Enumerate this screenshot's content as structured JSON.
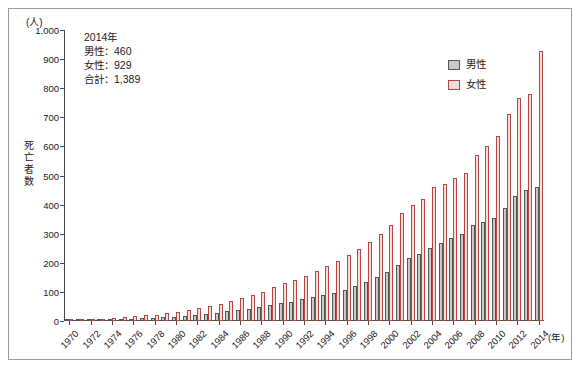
{
  "axis": {
    "y_unit": "(人)",
    "y_title_chars": [
      "死",
      "亡",
      "者",
      "数"
    ],
    "y_ticks": [
      "0",
      "100",
      "200",
      "300",
      "400",
      "500",
      "600",
      "700",
      "800",
      "900",
      "1,000"
    ],
    "x_unit": "(年)",
    "x_tick_labels": [
      "1970",
      "1972",
      "1974",
      "1976",
      "1978",
      "1980",
      "1982",
      "1984",
      "1986",
      "1988",
      "1990",
      "1992",
      "1994",
      "1996",
      "1998",
      "2000",
      "2002",
      "2004",
      "2006",
      "2008",
      "2010",
      "2012",
      "2014"
    ]
  },
  "annotation": {
    "line1": "2014年",
    "line2": "男性：460",
    "line3": "女性：929",
    "line4": "合計：1,389"
  },
  "legend": {
    "male": "男性",
    "female": "女性"
  },
  "colors": {
    "male_fill": "#c9c9c9",
    "male_edge": "#555555",
    "female_fill": "#f2dede",
    "female_edge": "#b5483f"
  },
  "chart_data": {
    "type": "bar",
    "title": "",
    "xlabel": "(年)",
    "ylabel": "死亡者数",
    "ylim": [
      0,
      1000
    ],
    "grid": false,
    "legend_position": "top-right",
    "categories": [
      1970,
      1971,
      1972,
      1973,
      1974,
      1975,
      1976,
      1977,
      1978,
      1979,
      1980,
      1981,
      1982,
      1983,
      1984,
      1985,
      1986,
      1987,
      1988,
      1989,
      1990,
      1991,
      1992,
      1993,
      1994,
      1995,
      1996,
      1997,
      1998,
      1999,
      2000,
      2001,
      2002,
      2003,
      2004,
      2005,
      2006,
      2007,
      2008,
      2009,
      2010,
      2011,
      2012,
      2013,
      2014
    ],
    "series": [
      {
        "name": "男性",
        "values": [
          2,
          2,
          3,
          4,
          6,
          7,
          8,
          9,
          11,
          13,
          14,
          17,
          20,
          24,
          28,
          33,
          38,
          42,
          47,
          55,
          62,
          66,
          75,
          82,
          90,
          97,
          106,
          120,
          135,
          150,
          170,
          192,
          215,
          232,
          250,
          268,
          285,
          300,
          330,
          340,
          355,
          390,
          430,
          450,
          460
        ]
      },
      {
        "name": "女性",
        "values": [
          3,
          4,
          5,
          7,
          10,
          13,
          16,
          19,
          22,
          27,
          31,
          37,
          44,
          52,
          60,
          70,
          80,
          90,
          100,
          118,
          132,
          140,
          155,
          172,
          190,
          205,
          228,
          248,
          272,
          300,
          330,
          370,
          400,
          420,
          460,
          470,
          490,
          510,
          570,
          600,
          635,
          710,
          765,
          780,
          929
        ]
      }
    ]
  }
}
